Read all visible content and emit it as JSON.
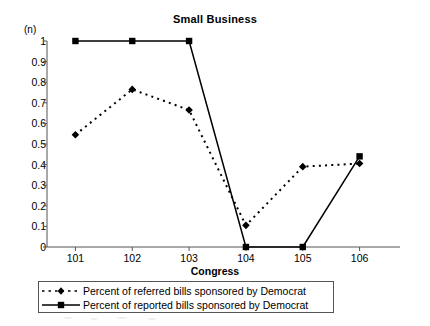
{
  "chart_data": {
    "type": "line",
    "title": "Small Business",
    "xlabel": "Congress",
    "ylabel": "(n)",
    "categories": [
      "101",
      "102",
      "103",
      "104",
      "105",
      "106"
    ],
    "x": [
      101,
      102,
      103,
      104,
      105,
      106
    ],
    "xlim": [
      100.5,
      106.5
    ],
    "ylim": [
      0,
      1
    ],
    "yticks": [
      "0",
      "0.1",
      "0.2",
      "0.3",
      "0.4",
      "0.5",
      "0.6",
      "0.7",
      "0.8",
      "0.9",
      "1"
    ],
    "ytick_values": [
      0,
      0.1,
      0.2,
      0.3,
      0.4,
      0.5,
      0.6,
      0.7,
      0.8,
      0.9,
      1
    ],
    "grid": false,
    "legend_position": "below-axis",
    "series": [
      {
        "name": "Percent of referred bills sponsored by Democrat",
        "values": [
          0.545,
          0.765,
          0.665,
          0.105,
          0.39,
          0.405
        ],
        "style": "dotted",
        "marker": "diamond",
        "color": "#000000"
      },
      {
        "name": "Percent of reported bills sponsored by Democrat",
        "values": [
          1.0,
          1.0,
          1.0,
          0.0,
          0.0,
          0.44
        ],
        "style": "solid",
        "marker": "square",
        "color": "#000000"
      }
    ]
  },
  "legend": {
    "entries": [
      {
        "label": "Percent of referred bills sponsored by Democrat",
        "marker": "diamond",
        "style": "dotted"
      },
      {
        "label": "Percent of reported bills sponsored by Democrat",
        "marker": "square",
        "style": "solid"
      }
    ]
  },
  "colors": {
    "ink": "#000000",
    "axis": "#555555",
    "legend_border": "#555555",
    "background": "#ffffff"
  }
}
